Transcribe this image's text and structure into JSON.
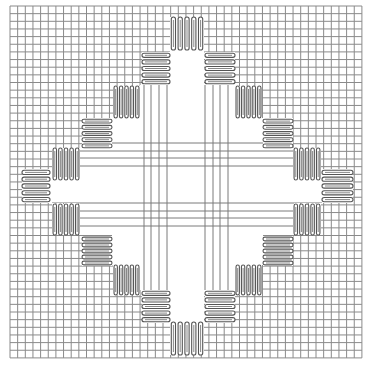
{
  "diagram": {
    "type": "needlepoint stitch diagram",
    "colors": {
      "background": "#ffffff",
      "grid": "#8a8a8a",
      "stitch_outline": "#555555"
    },
    "grid": {
      "origin_x": 10,
      "origin_y": 6,
      "spacing": 7.65,
      "count": 47
    },
    "blocks": [
      {
        "dir": "v",
        "x": 170,
        "y": 17,
        "w": 34,
        "h": 33
      },
      {
        "dir": "h",
        "x": 142,
        "y": 52,
        "w": 28,
        "h": 33
      },
      {
        "dir": "h",
        "x": 205,
        "y": 52,
        "w": 30,
        "h": 33
      },
      {
        "dir": "v",
        "x": 113,
        "y": 86,
        "w": 27,
        "h": 32
      },
      {
        "dir": "v",
        "x": 235,
        "y": 86,
        "w": 27,
        "h": 32
      },
      {
        "dir": "h",
        "x": 82,
        "y": 118,
        "w": 30,
        "h": 31
      },
      {
        "dir": "h",
        "x": 263,
        "y": 118,
        "w": 30,
        "h": 31
      },
      {
        "dir": "v",
        "x": 52,
        "y": 148,
        "w": 28,
        "h": 32
      },
      {
        "dir": "v",
        "x": 293,
        "y": 148,
        "w": 28,
        "h": 32
      },
      {
        "dir": "h",
        "x": 22,
        "y": 169,
        "w": 28,
        "h": 34
      },
      {
        "dir": "h",
        "x": 322,
        "y": 169,
        "w": 31,
        "h": 34
      },
      {
        "dir": "v",
        "x": 52,
        "y": 204,
        "w": 28,
        "h": 31
      },
      {
        "dir": "v",
        "x": 293,
        "y": 204,
        "w": 28,
        "h": 31
      },
      {
        "dir": "h",
        "x": 82,
        "y": 236,
        "w": 30,
        "h": 30
      },
      {
        "dir": "h",
        "x": 263,
        "y": 236,
        "w": 30,
        "h": 30
      },
      {
        "dir": "v",
        "x": 113,
        "y": 265,
        "w": 27,
        "h": 30
      },
      {
        "dir": "v",
        "x": 235,
        "y": 265,
        "w": 27,
        "h": 30
      },
      {
        "dir": "h",
        "x": 142,
        "y": 290,
        "w": 28,
        "h": 33
      },
      {
        "dir": "h",
        "x": 205,
        "y": 290,
        "w": 30,
        "h": 33
      },
      {
        "dir": "v",
        "x": 170,
        "y": 322,
        "w": 34,
        "h": 33
      }
    ],
    "center_lines": {
      "vertical_x": [
        144,
        151,
        159,
        167,
        205,
        213,
        220,
        228
      ],
      "horizontal_y": [
        143,
        151,
        158,
        166,
        203,
        211,
        218,
        226
      ],
      "extent": [
        82,
        293
      ]
    }
  }
}
